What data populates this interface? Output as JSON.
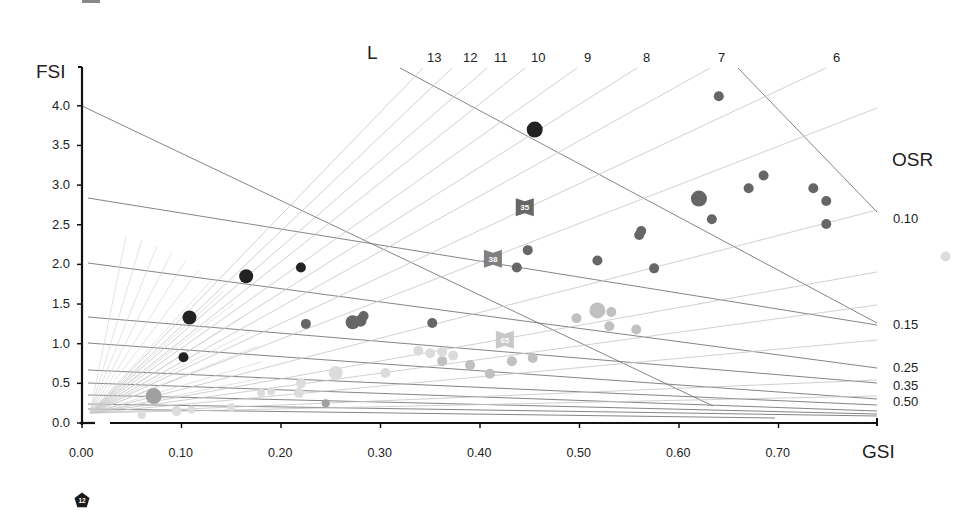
{
  "chart_data": {
    "type": "scatter",
    "title": "",
    "xlabel": "GSI",
    "ylabel": "FSI",
    "xlim": [
      0,
      0.8
    ],
    "ylim": [
      0,
      4.2
    ],
    "grid": false,
    "x_ticks": [
      "0.00",
      "0.10",
      "0.20",
      "0.30",
      "0.40",
      "0.50",
      "0.60",
      "0.70"
    ],
    "y_ticks": [
      "0.0",
      "0.5",
      "1.0",
      "1.5",
      "2.0",
      "2.5",
      "3.0",
      "3.5",
      "4.0"
    ],
    "reference_lines": {
      "L_title": "L",
      "L_labels": [
        "13",
        "12",
        "11",
        "10",
        "9",
        "8",
        "7",
        "6"
      ],
      "OSR_title": "OSR",
      "OSR_labels": [
        "0.10",
        "0.15",
        "0.25",
        "0.35",
        "0.50"
      ]
    },
    "series": [
      {
        "name": "dark",
        "color": "#222222",
        "points": [
          {
            "x": 0.455,
            "y": 3.7,
            "r": 8
          },
          {
            "x": 0.165,
            "y": 1.85,
            "r": 7
          },
          {
            "x": 0.22,
            "y": 1.96,
            "r": 5
          },
          {
            "x": 0.108,
            "y": 1.33,
            "r": 7
          },
          {
            "x": 0.102,
            "y": 0.83,
            "r": 5
          }
        ]
      },
      {
        "name": "mid-dark",
        "color": "#666666",
        "points": [
          {
            "x": 0.64,
            "y": 4.12,
            "r": 5
          },
          {
            "x": 0.62,
            "y": 2.83,
            "r": 8
          },
          {
            "x": 0.67,
            "y": 2.96,
            "r": 5
          },
          {
            "x": 0.685,
            "y": 3.12,
            "r": 5
          },
          {
            "x": 0.735,
            "y": 2.96,
            "r": 5
          },
          {
            "x": 0.748,
            "y": 2.8,
            "r": 5
          },
          {
            "x": 0.748,
            "y": 2.51,
            "r": 5
          },
          {
            "x": 0.633,
            "y": 2.57,
            "r": 5
          },
          {
            "x": 0.562,
            "y": 2.42,
            "r": 5
          },
          {
            "x": 0.56,
            "y": 2.37,
            "r": 5
          },
          {
            "x": 0.518,
            "y": 2.05,
            "r": 5
          },
          {
            "x": 0.575,
            "y": 1.95,
            "r": 5
          },
          {
            "x": 0.448,
            "y": 2.18,
            "r": 5
          },
          {
            "x": 0.437,
            "y": 1.96,
            "r": 5
          },
          {
            "x": 0.225,
            "y": 1.25,
            "r": 5
          },
          {
            "x": 0.272,
            "y": 1.27,
            "r": 7
          },
          {
            "x": 0.28,
            "y": 1.29,
            "r": 6
          },
          {
            "x": 0.283,
            "y": 1.35,
            "r": 5
          },
          {
            "x": 0.352,
            "y": 1.26,
            "r": 5
          }
        ]
      },
      {
        "name": "mid",
        "color": "#a0a0a0",
        "points": [
          {
            "x": 0.072,
            "y": 0.34,
            "r": 8
          },
          {
            "x": 0.245,
            "y": 0.25,
            "r": 4
          }
        ]
      },
      {
        "name": "light",
        "color": "#c0c0c0",
        "points": [
          {
            "x": 0.518,
            "y": 1.42,
            "r": 8
          },
          {
            "x": 0.532,
            "y": 1.4,
            "r": 5
          },
          {
            "x": 0.497,
            "y": 1.32,
            "r": 5
          },
          {
            "x": 0.53,
            "y": 1.22,
            "r": 5
          },
          {
            "x": 0.557,
            "y": 1.18,
            "r": 5
          },
          {
            "x": 0.362,
            "y": 0.78,
            "r": 5
          },
          {
            "x": 0.39,
            "y": 0.73,
            "r": 5
          },
          {
            "x": 0.41,
            "y": 0.62,
            "r": 5
          },
          {
            "x": 0.432,
            "y": 0.78,
            "r": 5
          },
          {
            "x": 0.453,
            "y": 0.82,
            "r": 5
          }
        ]
      },
      {
        "name": "very-light",
        "color": "#dcdcdc",
        "points": [
          {
            "x": 0.868,
            "y": 2.1,
            "r": 5
          },
          {
            "x": 0.255,
            "y": 0.63,
            "r": 7
          },
          {
            "x": 0.305,
            "y": 0.63,
            "r": 5
          },
          {
            "x": 0.338,
            "y": 0.91,
            "r": 5
          },
          {
            "x": 0.35,
            "y": 0.88,
            "r": 5
          },
          {
            "x": 0.362,
            "y": 0.9,
            "r": 5
          },
          {
            "x": 0.373,
            "y": 0.85,
            "r": 5
          },
          {
            "x": 0.22,
            "y": 0.5,
            "r": 5
          },
          {
            "x": 0.218,
            "y": 0.38,
            "r": 5
          },
          {
            "x": 0.18,
            "y": 0.38,
            "r": 4
          },
          {
            "x": 0.19,
            "y": 0.4,
            "r": 4
          },
          {
            "x": 0.15,
            "y": 0.2,
            "r": 4
          },
          {
            "x": 0.11,
            "y": 0.17,
            "r": 4
          },
          {
            "x": 0.095,
            "y": 0.15,
            "r": 5
          },
          {
            "x": 0.06,
            "y": 0.1,
            "r": 4
          }
        ]
      }
    ],
    "annotations": [
      {
        "label": "35",
        "x": 0.445,
        "y": 2.72,
        "shape": "bowtie-flag",
        "color": "#666666"
      },
      {
        "label": "38",
        "x": 0.413,
        "y": 2.07,
        "shape": "bowtie-flag",
        "color": "#808080"
      },
      {
        "label": "65",
        "x": 0.425,
        "y": 1.05,
        "shape": "bowtie-flag",
        "color": "#c8c8c8"
      }
    ],
    "legend_marker": {
      "label": "12",
      "shape": "pentagon",
      "color": "#1a1a1a"
    }
  }
}
